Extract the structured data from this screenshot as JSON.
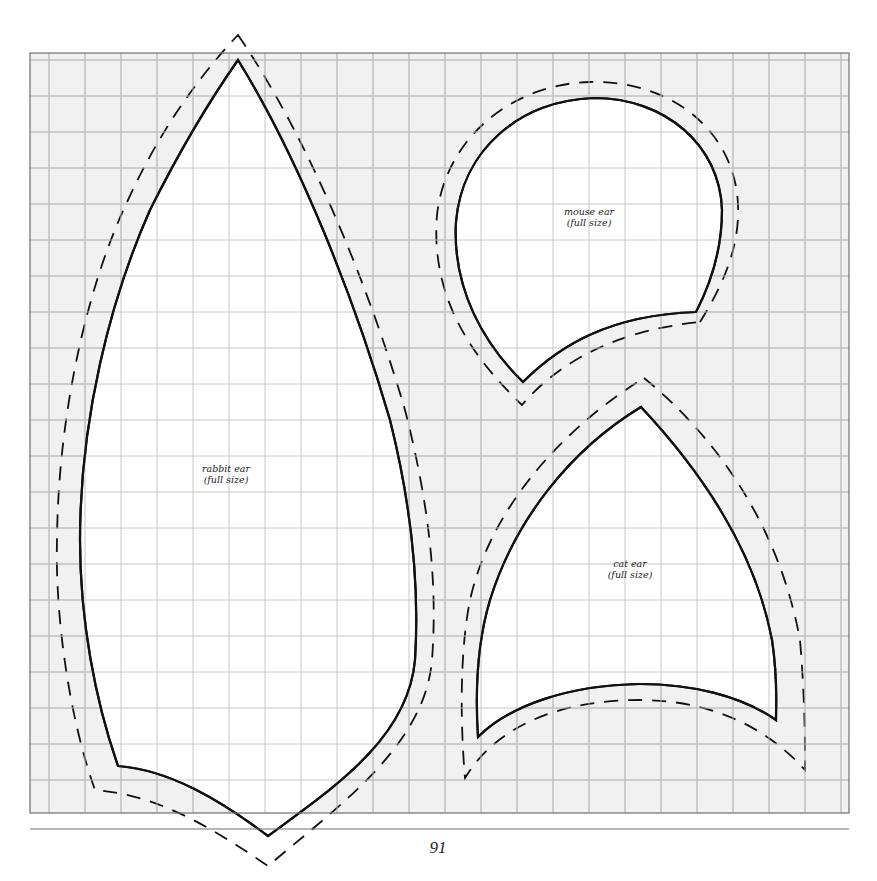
{
  "page": {
    "header_text": "",
    "page_number": "91",
    "background_color": "#ffffff",
    "grid": {
      "fill_color": "#f1f1f1",
      "line_color": "#b4b4b4",
      "border_color": "#777777",
      "x_start": 30,
      "y_start": 53,
      "x_end": 849,
      "y_end": 813,
      "spacing": 36
    },
    "footer_rule_color": "#777777"
  },
  "patterns": [
    {
      "id": "rabbit-ear",
      "title": "rabbit ear",
      "subtitle": "(full size)",
      "label_x": 226,
      "label_y": 469
    },
    {
      "id": "mouse-ear",
      "title": "mouse ear",
      "subtitle": "(full size)",
      "label_x": 590,
      "label_y": 206
    },
    {
      "id": "cat-ear",
      "title": "cat ear",
      "subtitle": "(full size)",
      "label_x": 637,
      "label_y": 560
    }
  ],
  "icons": {
    "cut_line": "solid-outline",
    "seam_allowance": "dashed-outline"
  }
}
